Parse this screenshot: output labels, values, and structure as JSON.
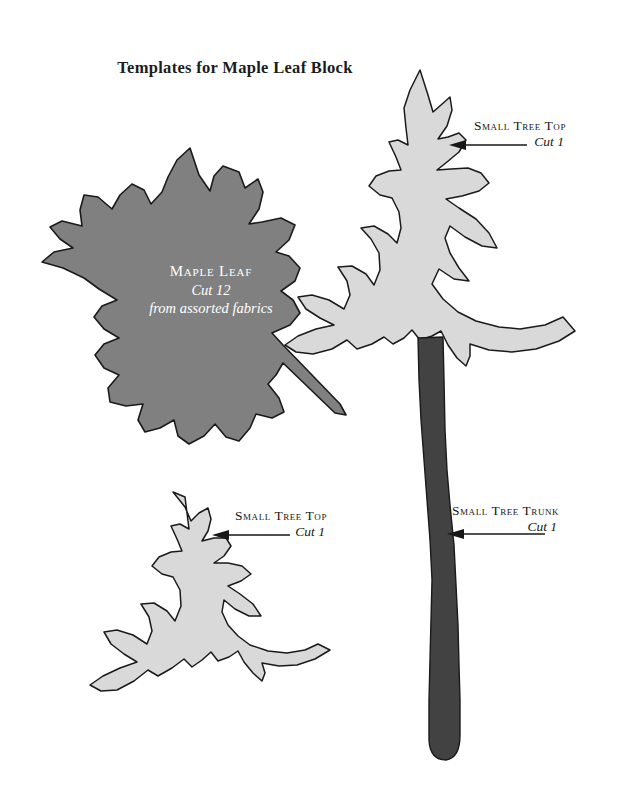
{
  "page": {
    "title": "Templates for Maple Leaf Block",
    "background_color": "#ffffff"
  },
  "palette": {
    "leaf_fill": "#808080",
    "leaf_outline": "#1a1a1a",
    "tree_fill": "#d9d9d9",
    "tree_outline": "#1a1a1a",
    "trunk_fill": "#424242",
    "trunk_outline": "#1a1a1a",
    "text_dark": "#171717",
    "text_light": "#ffffff"
  },
  "templates": {
    "maple_leaf": {
      "name": "Maple Leaf",
      "cut": "Cut 12",
      "note": "from assorted fabrics"
    },
    "small_tree_top_large": {
      "name": "Small Tree Top",
      "cut": "Cut 1"
    },
    "small_tree_top_small": {
      "name": "Small Tree Top",
      "cut": "Cut 1"
    },
    "small_tree_trunk": {
      "name": "Small Tree Trunk",
      "cut": "Cut 1"
    }
  }
}
